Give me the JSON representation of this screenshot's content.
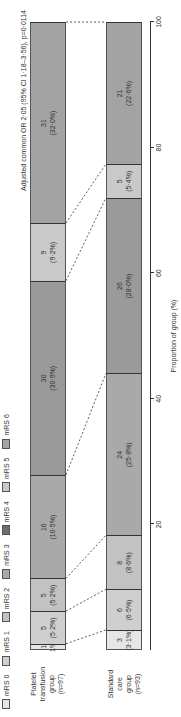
{
  "chart_data": {
    "type": "bar",
    "orientation": "horizontal stacked 100% (image rotated 90°)",
    "title": "",
    "xlabel": "Proportion of group (%)",
    "ylabel": "",
    "xlim": [
      0,
      100
    ],
    "ticks": [
      "20",
      "40",
      "60",
      "80",
      "100"
    ],
    "annotation": "Adjusted common OR 2·05 (95% CI 1·18–3·56), p=0·0114",
    "legend": [
      "mRS 0",
      "mRS 1",
      "mRS 2",
      "mRS 3",
      "mRS 4",
      "mRS 5",
      "mRS 6"
    ],
    "legend_position": "top",
    "categories": [
      "Platelet transfusion group (n=97)",
      "Standard care group (n=93)"
    ],
    "series": [
      {
        "name": "mRS 0",
        "color": "#e6e6e6",
        "values": [
          1.0,
          3.2
        ],
        "counts": [
          1,
          3
        ]
      },
      {
        "name": "mRS 1",
        "color": "#cfcfcf",
        "values": [
          5.2,
          6.5
        ],
        "counts": [
          5,
          6
        ]
      },
      {
        "name": "mRS 2",
        "color": "#c2c2c2",
        "values": [
          5.2,
          8.6
        ],
        "counts": [
          5,
          8
        ]
      },
      {
        "name": "mRS 3",
        "color": "#a9a9a9",
        "values": [
          16.5,
          25.8
        ],
        "counts": [
          16,
          24
        ]
      },
      {
        "name": "mRS 4",
        "color": "#8f8f8f",
        "values": [
          30.9,
          28.0
        ],
        "counts": [
          30,
          26
        ]
      },
      {
        "name": "mRS 5",
        "color": "#c9c9c9",
        "values": [
          9.2,
          5.4
        ],
        "counts": [
          9,
          5
        ]
      },
      {
        "name": "mRS 6",
        "color": "#a3a3a3",
        "values": [
          32.0,
          22.6
        ],
        "counts": [
          31,
          21
        ]
      }
    ]
  },
  "legend": [
    {
      "label": "mRS 0",
      "color": "#e6e6e6"
    },
    {
      "label": "mRS 1",
      "color": "#cfcfcf"
    },
    {
      "label": "mRS 2",
      "color": "#c2c2c2"
    },
    {
      "label": "mRS 3",
      "color": "#a9a9a9"
    },
    {
      "label": "mRS 4",
      "color": "#6e6e6e"
    },
    {
      "label": "mRS 5",
      "color": "#c9c9c9"
    },
    {
      "label": "mRS 6",
      "color": "#a3a3a3"
    }
  ],
  "groups": [
    {
      "label_lines": [
        "Platelet",
        "transfusion",
        "group",
        "(n=97)"
      ],
      "segments": [
        {
          "n": "1",
          "pct": "1%",
          "width": 1.0,
          "color": "#e6e6e6"
        },
        {
          "n": "5",
          "pct": "(5·2%)",
          "width": 5.2,
          "color": "#cfcfcf"
        },
        {
          "n": "5",
          "pct": "(5·2%)",
          "width": 5.2,
          "color": "#c2c2c2"
        },
        {
          "n": "16",
          "pct": "(16·5%)",
          "width": 16.5,
          "color": "#a9a9a9"
        },
        {
          "n": "30",
          "pct": "(30·9%)",
          "width": 30.9,
          "color": "#9a9a9a"
        },
        {
          "n": "9",
          "pct": "(9·2%)",
          "width": 9.2,
          "color": "#c9c9c9"
        },
        {
          "n": "31",
          "pct": "(32·0%)",
          "width": 32.0,
          "color": "#a3a3a3"
        }
      ]
    },
    {
      "label_lines": [
        "Standard",
        "care",
        "group",
        "(n=93)"
      ],
      "segments": [
        {
          "n": "3",
          "pct": "(3·1%)",
          "width": 3.2,
          "color": "#e6e6e6"
        },
        {
          "n": "6",
          "pct": "(6·5%)",
          "width": 6.5,
          "color": "#cfcfcf"
        },
        {
          "n": "8",
          "pct": "(8·6%)",
          "width": 8.6,
          "color": "#c2c2c2"
        },
        {
          "n": "24",
          "pct": "(25·8%)",
          "width": 25.8,
          "color": "#a9a9a9"
        },
        {
          "n": "26",
          "pct": "(28·0%)",
          "width": 28.0,
          "color": "#9a9a9a"
        },
        {
          "n": "5",
          "pct": "(5·4%)",
          "width": 5.4,
          "color": "#c9c9c9"
        },
        {
          "n": "21",
          "pct": "(22·6%)",
          "width": 22.6,
          "color": "#a3a3a3"
        }
      ]
    }
  ],
  "axis": {
    "title": "Proportion of group (%)",
    "ticks": [
      {
        "value": 20,
        "label": "20"
      },
      {
        "value": 40,
        "label": "40"
      },
      {
        "value": 60,
        "label": "60"
      },
      {
        "value": 80,
        "label": "80"
      },
      {
        "value": 100,
        "label": "100"
      }
    ]
  },
  "stat_text": "Adjusted common OR 2·05 (95% CI 1·18–3·56), p=0·0114"
}
